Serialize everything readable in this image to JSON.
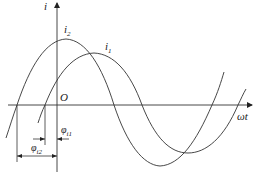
{
  "diagram": {
    "type": "sinusoidal-phase-diagram",
    "axes": {
      "vertical_label": "i",
      "horizontal_label": "ωt",
      "origin_label": "O"
    },
    "curves": [
      {
        "name": "i2",
        "label_base": "i",
        "label_sub": "2",
        "description": "leading sinusoid, peak left of axis origin"
      },
      {
        "name": "i1",
        "label_base": "i",
        "label_sub": "1",
        "description": "lagging sinusoid"
      }
    ],
    "phase_markers": [
      {
        "name": "phi_i1",
        "label_base": "φ",
        "label_sub": "i1"
      },
      {
        "name": "phi_i2",
        "label_base": "φ",
        "label_sub": "i2"
      }
    ],
    "colors": {
      "stroke": "#333333",
      "background": "#ffffff"
    }
  }
}
